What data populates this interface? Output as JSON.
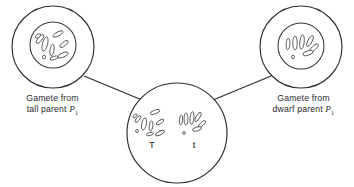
{
  "figure": {
    "kind": "biology-diagram",
    "background_color": "#ffffff",
    "line_color": "#2b2b2b",
    "text_color": "#2a2a2a"
  },
  "gametes": {
    "left": {
      "name": "tall-parent-gamete",
      "caption_line1": "Gamete from",
      "caption_line2_prefix": "tall parent ",
      "caption_gene": "P",
      "caption_gene_subscript": "1",
      "allele": "T",
      "cell": {
        "cx": 53,
        "cy": 47,
        "r": 41
      },
      "nucleus": {
        "cx": 53,
        "cy": 45,
        "r": 23
      },
      "chromosomes": [
        {
          "cx": 40,
          "cy": 39,
          "rx": 2.0,
          "ry": 5.4,
          "rot": 38
        },
        {
          "cx": 45,
          "cy": 44,
          "rx": 2.6,
          "ry": 7.4,
          "rot": 14
        },
        {
          "cx": 38,
          "cy": 36,
          "rx": 1.6,
          "ry": 3.0,
          "rot": 55
        },
        {
          "cx": 58,
          "cy": 34,
          "rx": 2.0,
          "ry": 5.6,
          "rot": 62
        },
        {
          "cx": 52,
          "cy": 50,
          "rx": 2.0,
          "ry": 5.8,
          "rot": 8
        },
        {
          "cx": 64,
          "cy": 44,
          "rx": 1.9,
          "ry": 5.0,
          "rot": 52
        },
        {
          "cx": 63,
          "cy": 55,
          "rx": 2.1,
          "ry": 5.6,
          "rot": 66
        },
        {
          "cx": 44,
          "cy": 57,
          "rx": 1.6,
          "ry": 1.8,
          "rot": 0
        },
        {
          "cx": 54,
          "cy": 58,
          "rx": 1.7,
          "ry": 4.2,
          "rot": 72
        }
      ]
    },
    "right": {
      "name": "dwarf-parent-gamete",
      "caption_line1": "Gamete from",
      "caption_line2_prefix": "dwarf parent ",
      "caption_gene": "P",
      "caption_gene_subscript": "1",
      "allele": "t",
      "cell": {
        "cx": 301,
        "cy": 47,
        "r": 41
      },
      "nucleus": {
        "cx": 301,
        "cy": 46,
        "r": 23
      },
      "chromosomes": [
        {
          "cx": 288,
          "cy": 44,
          "rx": 1.9,
          "ry": 5.6,
          "rot": 4
        },
        {
          "cx": 295,
          "cy": 43,
          "rx": 2.2,
          "ry": 7.0,
          "rot": 0
        },
        {
          "cx": 302,
          "cy": 42,
          "rx": 2.2,
          "ry": 7.2,
          "rot": 6
        },
        {
          "cx": 310,
          "cy": 41,
          "rx": 2.1,
          "ry": 6.0,
          "rot": 28
        },
        {
          "cx": 314,
          "cy": 48,
          "rx": 2.0,
          "ry": 5.4,
          "rot": 48
        },
        {
          "cx": 308,
          "cy": 53,
          "rx": 2.2,
          "ry": 5.2,
          "rot": 72
        },
        {
          "cx": 293,
          "cy": 57,
          "rx": 1.5,
          "ry": 1.7,
          "rot": 0
        }
      ]
    }
  },
  "zygote": {
    "name": "zygote-cell",
    "cell": {
      "cx": 177,
      "cy": 133,
      "r": 50
    },
    "allele_left": {
      "label": "T",
      "x": 152,
      "y": 148
    },
    "allele_right": {
      "label": "t",
      "x": 194,
      "y": 148
    },
    "chromosomes_left": [
      {
        "cx": 138,
        "cy": 119,
        "rx": 1.7,
        "ry": 4.0,
        "rot": 40
      },
      {
        "cx": 144,
        "cy": 124,
        "rx": 2.3,
        "ry": 6.2,
        "rot": 10
      },
      {
        "cx": 135,
        "cy": 116,
        "rx": 1.3,
        "ry": 2.4,
        "rot": 50
      },
      {
        "cx": 155,
        "cy": 112,
        "rx": 1.8,
        "ry": 5.0,
        "rot": 70
      },
      {
        "cx": 151,
        "cy": 126,
        "rx": 1.8,
        "ry": 5.0,
        "rot": 6
      },
      {
        "cx": 160,
        "cy": 122,
        "rx": 1.7,
        "ry": 4.4,
        "rot": 56
      },
      {
        "cx": 160,
        "cy": 133,
        "rx": 1.9,
        "ry": 5.0,
        "rot": 64
      },
      {
        "cx": 137,
        "cy": 131,
        "rx": 1.4,
        "ry": 1.6,
        "rot": 0
      },
      {
        "cx": 150,
        "cy": 134,
        "rx": 1.5,
        "ry": 3.6,
        "rot": 76
      }
    ],
    "chromosomes_right": [
      {
        "cx": 181,
        "cy": 120,
        "rx": 1.6,
        "ry": 5.0,
        "rot": 4
      },
      {
        "cx": 186,
        "cy": 119,
        "rx": 1.9,
        "ry": 6.2,
        "rot": 0
      },
      {
        "cx": 192,
        "cy": 118,
        "rx": 1.9,
        "ry": 6.4,
        "rot": 6
      },
      {
        "cx": 198,
        "cy": 117,
        "rx": 1.8,
        "ry": 5.2,
        "rot": 30
      },
      {
        "cx": 202,
        "cy": 124,
        "rx": 1.7,
        "ry": 4.6,
        "rot": 50
      },
      {
        "cx": 197,
        "cy": 129,
        "rx": 1.9,
        "ry": 4.6,
        "rot": 74
      },
      {
        "cx": 184,
        "cy": 133,
        "rx": 1.3,
        "ry": 1.5,
        "rot": 0
      }
    ]
  },
  "fusion_lines": [
    {
      "name": "left-fusion-line",
      "x1": 84,
      "y1": 76,
      "x2": 142,
      "y2": 100
    },
    {
      "name": "right-fusion-line",
      "x1": 271,
      "y1": 76,
      "x2": 213,
      "y2": 100
    }
  ]
}
